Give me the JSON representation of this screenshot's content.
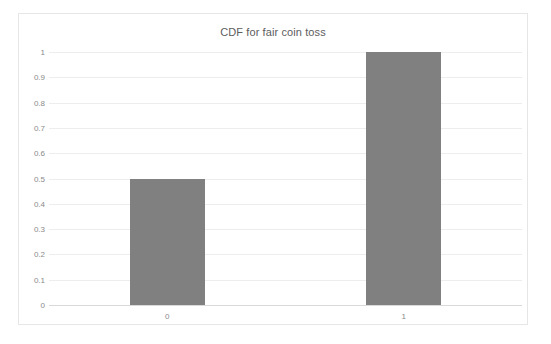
{
  "chart_data": {
    "type": "bar",
    "title": "CDF for fair coin toss",
    "xlabel": "",
    "ylabel": "",
    "categories": [
      "0",
      "1"
    ],
    "values": [
      0.5,
      1
    ],
    "ylim": [
      0,
      1
    ],
    "y_ticks": [
      "0",
      "0.1",
      "0.2",
      "0.3",
      "0.4",
      "0.5",
      "0.6",
      "0.7",
      "0.8",
      "0.9",
      "1"
    ],
    "y_tick_values": [
      0,
      0.1,
      0.2,
      0.3,
      0.4,
      0.5,
      0.6,
      0.7,
      0.8,
      0.9,
      1
    ],
    "grid": true,
    "legend": false,
    "series": [
      {
        "name": "CDF",
        "values": [
          0.5,
          1
        ],
        "color": "#808080"
      }
    ],
    "colors": {
      "bar": "#808080",
      "gridline": "#ededed",
      "axis": "#d9d9d9",
      "title_text": "#5d5d5d",
      "tick_text": "#8a8a8a",
      "plot_background": "#ffffff",
      "frame_border": "#e6e6e6"
    }
  }
}
